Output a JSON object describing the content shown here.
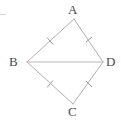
{
  "figure": {
    "type": "geometry-diagram",
    "canvas": {
      "width": 121,
      "height": 121,
      "background": "#ffffff"
    },
    "stroke_color": "#b0b0b0",
    "tick_color": "#9a9a9a",
    "label_color": "#4a4a4a",
    "vertices": [
      {
        "id": "A",
        "label": "A",
        "x": 74,
        "y": 19,
        "label_x": 68,
        "label_y": 3
      },
      {
        "id": "B",
        "label": "B",
        "x": 27,
        "y": 62,
        "label_x": 9,
        "label_y": 55
      },
      {
        "id": "C",
        "label": "C",
        "x": 73,
        "y": 104,
        "label_x": 68,
        "label_y": 105
      },
      {
        "id": "D",
        "label": "D",
        "x": 103,
        "y": 62,
        "label_x": 106,
        "label_y": 55
      }
    ],
    "edges": [
      {
        "id": "AB",
        "from": "A",
        "to": "B",
        "ticks": 1
      },
      {
        "id": "AD",
        "from": "A",
        "to": "D",
        "ticks": 1
      },
      {
        "id": "BC",
        "from": "B",
        "to": "C",
        "ticks": 1
      },
      {
        "id": "CD",
        "from": "C",
        "to": "D",
        "ticks": 1
      }
    ],
    "diagonals": [
      {
        "id": "BD",
        "from": "B",
        "to": "D",
        "ticks": 0
      }
    ],
    "tick_marks": [
      {
        "id": "tick-AB",
        "edge": "AB",
        "x": 50,
        "y": 41
      },
      {
        "id": "tick-AD",
        "edge": "AD",
        "x": 89,
        "y": 40
      },
      {
        "id": "tick-BC",
        "edge": "BC",
        "x": 50,
        "y": 84
      },
      {
        "id": "tick-CD",
        "edge": "CD",
        "x": 89,
        "y": 84
      }
    ],
    "artifacts": [
      {
        "id": "stray-mark",
        "x": 0,
        "y": 14,
        "width": 6,
        "height": 1
      }
    ]
  }
}
